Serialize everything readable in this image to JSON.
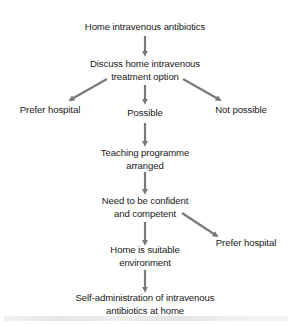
{
  "diagram": {
    "type": "flowchart",
    "arrow_color": "#7a7a7a",
    "text_color": "#1a1a1a",
    "nodes": {
      "start": {
        "lines": [
          "Home intravenous antibiotics"
        ]
      },
      "discuss": {
        "lines": [
          "Discuss home intravenous",
          "treatment option"
        ]
      },
      "prefer_hospital_1": {
        "lines": [
          "Prefer hospital"
        ]
      },
      "possible": {
        "lines": [
          "Possible"
        ]
      },
      "not_possible": {
        "lines": [
          "Not possible"
        ]
      },
      "teaching": {
        "lines": [
          "Teaching programme",
          "arranged"
        ]
      },
      "confident": {
        "lines": [
          "Need to be confident",
          "and competent"
        ]
      },
      "prefer_hospital_2": {
        "lines": [
          "Prefer hospital"
        ]
      },
      "home_suitable": {
        "lines": [
          "Home is suitable",
          "environment"
        ]
      },
      "self_admin": {
        "lines": [
          "Self-administration of intravenous",
          "antibiotics at home"
        ]
      }
    },
    "edges": [
      {
        "from": "start",
        "to": "discuss"
      },
      {
        "from": "discuss",
        "to": "prefer_hospital_1"
      },
      {
        "from": "discuss",
        "to": "possible"
      },
      {
        "from": "discuss",
        "to": "not_possible"
      },
      {
        "from": "possible",
        "to": "teaching"
      },
      {
        "from": "teaching",
        "to": "confident"
      },
      {
        "from": "confident",
        "to": "prefer_hospital_2"
      },
      {
        "from": "confident",
        "to": "home_suitable"
      },
      {
        "from": "home_suitable",
        "to": "self_admin"
      }
    ]
  }
}
